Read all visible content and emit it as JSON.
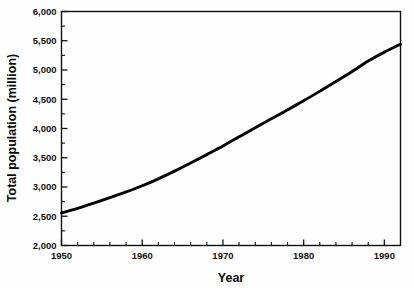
{
  "chart_data": {
    "type": "line",
    "title": "",
    "subtitle": "",
    "xlabel": "Year",
    "ylabel": "Total population (million)",
    "xlim": [
      1950,
      1992
    ],
    "ylim": [
      2000,
      6000
    ],
    "grid": false,
    "legend": null,
    "legend_position": "none",
    "x_tick_labels": [
      "1950",
      "1960",
      "1970",
      "1980",
      "1990"
    ],
    "x_major_ticks": [
      1950,
      1960,
      1970,
      1980,
      1990
    ],
    "x_minor_tick_interval": 2,
    "y_tick_labels": [
      "2,000",
      "2,500",
      "3,000",
      "3,500",
      "4,000",
      "4,500",
      "5,000",
      "5,500",
      "6,000"
    ],
    "y_major_ticks": [
      2000,
      2500,
      3000,
      3500,
      4000,
      4500,
      5000,
      5500,
      6000
    ],
    "y_minor_tick_interval": 250,
    "series": [
      {
        "name": "Total population",
        "color": "#000000",
        "x": [
          1950,
          1952,
          1954,
          1956,
          1958,
          1960,
          1962,
          1964,
          1966,
          1968,
          1970,
          1972,
          1974,
          1976,
          1978,
          1980,
          1982,
          1984,
          1986,
          1988,
          1990,
          1992
        ],
        "values": [
          2556,
          2636,
          2724,
          2817,
          2915,
          3021,
          3140,
          3271,
          3410,
          3554,
          3700,
          3858,
          4014,
          4165,
          4319,
          4474,
          4637,
          4804,
          4975,
          5153,
          5306,
          5440
        ]
      }
    ]
  },
  "axes": {
    "x_title": "Year",
    "y_title": "Total population (million)"
  },
  "colors": {
    "line": "#000000",
    "frame": "#111111",
    "text": "#0a0a0a",
    "background": "#fefefe"
  }
}
